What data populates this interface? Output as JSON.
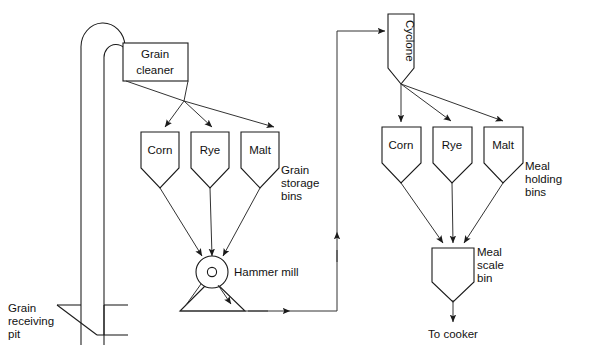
{
  "diagram": {
    "background": "#ffffff",
    "line_color": "#1a1a1a",
    "text_color": "#111111"
  },
  "equipment": {
    "grain_cleaner": {
      "label_line1": "Grain",
      "label_line2": "cleaner"
    },
    "cyclone": {
      "label": "Cyclone"
    },
    "hammer_mill": {
      "label": "Hammer mill"
    },
    "meal_scale_bin": {
      "label_line1": "Meal",
      "label_line2": "scale",
      "label_line3": "bin"
    },
    "grain_receiving_pit": {
      "label_line1": "Grain",
      "label_line2": "receiving",
      "label_line3": "pit"
    }
  },
  "grain_storage_bins": {
    "group_label_line1": "Grain",
    "group_label_line2": "storage",
    "group_label_line3": "bins",
    "bins": [
      {
        "label": "Corn"
      },
      {
        "label": "Rye"
      },
      {
        "label": "Malt"
      }
    ]
  },
  "meal_holding_bins": {
    "group_label_line1": "Meal",
    "group_label_line2": "holding",
    "group_label_line3": "bins",
    "bins": [
      {
        "label": "Corn"
      },
      {
        "label": "Rye"
      },
      {
        "label": "Malt"
      }
    ]
  },
  "outputs": {
    "to_cooker": "To cooker"
  }
}
